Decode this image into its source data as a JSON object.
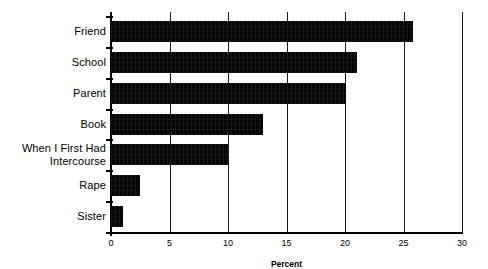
{
  "chart_data": {
    "type": "bar",
    "orientation": "horizontal",
    "title": "",
    "xlabel": "Percent",
    "ylabel": "",
    "categories": [
      "Friend",
      "School",
      "Parent",
      "Book",
      "When I First Had\nIntercourse",
      "Rape",
      "Sister"
    ],
    "values": [
      25.8,
      21.0,
      20.1,
      13.0,
      10.0,
      2.5,
      1.0
    ],
    "series": [
      {
        "name": "Percent",
        "values": [
          25.8,
          21.0,
          20.1,
          13.0,
          10.0,
          2.5,
          1.0
        ]
      }
    ],
    "xlim": [
      0,
      30
    ],
    "xticks": [
      0,
      5,
      10,
      15,
      20,
      25,
      30
    ],
    "xtick_labels": [
      "0",
      "5",
      "10",
      "15",
      "20",
      "25",
      "30"
    ],
    "grid": "vertical",
    "legend": "none",
    "bar_color": "#000000",
    "background_color": "#ffffff"
  }
}
